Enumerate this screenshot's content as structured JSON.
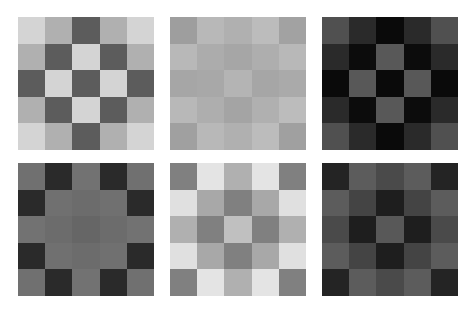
{
  "layout": {
    "rows": 2,
    "cols": 3,
    "grid_size": 5
  },
  "panels": [
    {
      "id": "panel-1",
      "x": 18,
      "y": 17,
      "cells": [
        [
          "#d4d4d4",
          "#b0b0b0",
          "#5c5c5c",
          "#b0b0b0",
          "#d4d4d4"
        ],
        [
          "#b0b0b0",
          "#5c5c5c",
          "#d4d4d4",
          "#5c5c5c",
          "#b0b0b0"
        ],
        [
          "#5c5c5c",
          "#d4d4d4",
          "#5c5c5c",
          "#d4d4d4",
          "#5c5c5c"
        ],
        [
          "#b0b0b0",
          "#5c5c5c",
          "#d4d4d4",
          "#5c5c5c",
          "#b0b0b0"
        ],
        [
          "#d4d4d4",
          "#b0b0b0",
          "#5c5c5c",
          "#b0b0b0",
          "#d4d4d4"
        ]
      ]
    },
    {
      "id": "panel-2",
      "x": 170,
      "y": 17,
      "cells": [
        [
          "#9e9e9e",
          "#b8b8b8",
          "#b0b0b0",
          "#bcbcbc",
          "#a2a2a2"
        ],
        [
          "#b8b8b8",
          "#acacac",
          "#a6a6a6",
          "#aeaeae",
          "#b8b8b8"
        ],
        [
          "#a6a6a6",
          "#a8a8a8",
          "#b4b4b4",
          "#a6a6a6",
          "#aaaaaa"
        ],
        [
          "#b8b8b8",
          "#aeaeae",
          "#a4a4a4",
          "#b0b0b0",
          "#bcbcbc"
        ],
        [
          "#a0a0a0",
          "#b8b8b8",
          "#b0b0b0",
          "#bcbcbc",
          "#a0a0a0"
        ]
      ]
    },
    {
      "id": "panel-3",
      "x": 322,
      "y": 17,
      "cells": [
        [
          "#505050",
          "#2a2a2a",
          "#0a0a0a",
          "#2a2a2a",
          "#505050"
        ],
        [
          "#2a2a2a",
          "#0c0c0c",
          "#585858",
          "#0c0c0c",
          "#2a2a2a"
        ],
        [
          "#0a0a0a",
          "#585858",
          "#0a0a0a",
          "#585858",
          "#0a0a0a"
        ],
        [
          "#2a2a2a",
          "#0c0c0c",
          "#585858",
          "#0c0c0c",
          "#2a2a2a"
        ],
        [
          "#505050",
          "#2a2a2a",
          "#0a0a0a",
          "#2a2a2a",
          "#505050"
        ]
      ]
    },
    {
      "id": "panel-4",
      "x": 18,
      "y": 163,
      "cells": [
        [
          "#707070",
          "#2a2a2a",
          "#727272",
          "#2a2a2a",
          "#707070"
        ],
        [
          "#2a2a2a",
          "#707070",
          "#6c6c6c",
          "#707070",
          "#2a2a2a"
        ],
        [
          "#727272",
          "#6c6c6c",
          "#666666",
          "#6c6c6c",
          "#727272"
        ],
        [
          "#2a2a2a",
          "#707070",
          "#6c6c6c",
          "#707070",
          "#2a2a2a"
        ],
        [
          "#707070",
          "#2a2a2a",
          "#727272",
          "#2a2a2a",
          "#707070"
        ]
      ]
    },
    {
      "id": "panel-5",
      "x": 170,
      "y": 163,
      "cells": [
        [
          "#808080",
          "#e4e4e4",
          "#b0b0b0",
          "#e4e4e4",
          "#808080"
        ],
        [
          "#e0e0e0",
          "#a8a8a8",
          "#808080",
          "#a8a8a8",
          "#e0e0e0"
        ],
        [
          "#b0b0b0",
          "#808080",
          "#c0c0c0",
          "#808080",
          "#b0b0b0"
        ],
        [
          "#e0e0e0",
          "#a8a8a8",
          "#808080",
          "#a8a8a8",
          "#e0e0e0"
        ],
        [
          "#808080",
          "#e4e4e4",
          "#b0b0b0",
          "#e4e4e4",
          "#808080"
        ]
      ]
    },
    {
      "id": "panel-6",
      "x": 322,
      "y": 163,
      "cells": [
        [
          "#242424",
          "#5c5c5c",
          "#4a4a4a",
          "#5c5c5c",
          "#242424"
        ],
        [
          "#5c5c5c",
          "#444444",
          "#1e1e1e",
          "#444444",
          "#5c5c5c"
        ],
        [
          "#4a4a4a",
          "#1e1e1e",
          "#585858",
          "#1e1e1e",
          "#4a4a4a"
        ],
        [
          "#5c5c5c",
          "#444444",
          "#1e1e1e",
          "#444444",
          "#5c5c5c"
        ],
        [
          "#242424",
          "#5c5c5c",
          "#4a4a4a",
          "#5c5c5c",
          "#242424"
        ]
      ]
    }
  ]
}
